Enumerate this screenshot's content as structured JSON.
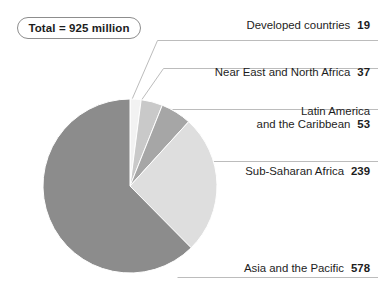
{
  "badge": {
    "text": "Total = 925 million"
  },
  "chart_data": {
    "type": "pie",
    "title": "",
    "subtitle": "",
    "xlabel": "",
    "ylabel": "",
    "units": "million",
    "total": 925,
    "total_label": "Total = 925 million",
    "legend_position": "callout-labels-right",
    "grid": false,
    "start_angle_deg": 0,
    "direction": "clockwise",
    "categories": [
      "Developed countries",
      "Near East and North Africa",
      "Latin America and the Caribbean",
      "Sub-Saharan Africa",
      "Asia and the Pacific"
    ],
    "values": [
      19,
      37,
      53,
      239,
      578
    ],
    "percentages": [
      2.05,
      4.0,
      5.73,
      25.84,
      62.49
    ],
    "colors": [
      "#f2f2f2",
      "#c9c9c9",
      "#a6a6a6",
      "#dedede",
      "#8c8c8c"
    ],
    "slices": [
      {
        "label": "Developed countries",
        "value": 19,
        "color": "#f2f2f2"
      },
      {
        "label": "Near East and North Africa",
        "value": 37,
        "color": "#c9c9c9"
      },
      {
        "label": "Latin America and the Caribbean",
        "value": 53,
        "color": "#a6a6a6"
      },
      {
        "label": "Sub-Saharan Africa",
        "value": 239,
        "color": "#dedede"
      },
      {
        "label": "Asia and the Pacific",
        "value": 578,
        "color": "#8c8c8c"
      }
    ]
  },
  "callouts": {
    "developed": {
      "line1": "Developed countries",
      "line2": "",
      "value": "19"
    },
    "neareast": {
      "line1": "Near East and North Africa",
      "line2": "",
      "value": "37"
    },
    "latin": {
      "line1": "Latin America",
      "line2": "and the Caribbean",
      "value": "53"
    },
    "subsaharan": {
      "line1": "Sub-Saharan Africa",
      "line2": "",
      "value": "239"
    },
    "asia": {
      "line1": "Asia and the Pacific",
      "line2": "",
      "value": "578"
    }
  },
  "style": {
    "background": "#ffffff",
    "text_color": "#1d1d1d",
    "leader_color": "#b9b9b9",
    "badge_border": "#8d8d8d"
  }
}
